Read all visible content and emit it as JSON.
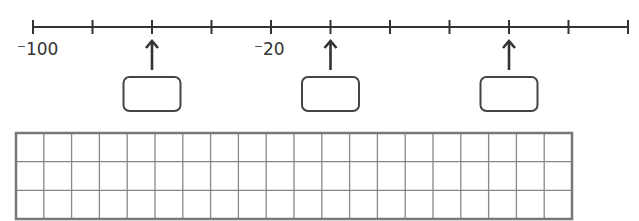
{
  "number_line": {
    "start_value": -100,
    "step": 20,
    "tick_count": 11,
    "tick_values": [
      -100,
      -80,
      -60,
      -40,
      -20,
      0,
      20,
      40,
      60,
      80,
      100
    ],
    "labels": [
      {
        "tick_index": 0,
        "text": "⁻100"
      },
      {
        "tick_index": 4,
        "text": "⁻20"
      }
    ],
    "arrows": [
      {
        "tick_index": 2,
        "value": -60,
        "answer_box": ""
      },
      {
        "tick_index": 5,
        "value": 0,
        "answer_box": ""
      },
      {
        "tick_index": 8,
        "value": 60,
        "answer_box": ""
      }
    ],
    "line_color": "#333333"
  },
  "grid": {
    "rows": 3,
    "columns": 20,
    "border_color": "#777777",
    "line_color": "#888888"
  }
}
